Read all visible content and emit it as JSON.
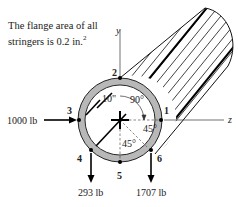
{
  "note": {
    "line1": "The flange area of all",
    "line2": "stringers is 0.2 in.",
    "exponent": "2"
  },
  "axes": {
    "y": "y",
    "z": "z"
  },
  "stringers": [
    {
      "id": "1",
      "label": "1"
    },
    {
      "id": "2",
      "label": "2"
    },
    {
      "id": "3",
      "label": "3"
    },
    {
      "id": "4",
      "label": "4"
    },
    {
      "id": "5",
      "label": "5"
    },
    {
      "id": "6",
      "label": "6"
    }
  ],
  "dimensions": {
    "radius": "10\"",
    "angle_top_right": "90°",
    "angle_right_lower": "45°",
    "angle_lower": "45°"
  },
  "loads": {
    "stringer3": "1000 lb",
    "stringer4": "293 lb",
    "stringer6": "1707 lb"
  },
  "colors": {
    "ring": "#b8b8b8",
    "stroke": "#111111",
    "background": "#ffffff"
  }
}
